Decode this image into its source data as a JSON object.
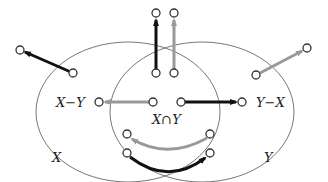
{
  "diagram": {
    "colors": {
      "ellipse": "#777777",
      "dark_arrow": "#111111",
      "light_arrow": "#999999",
      "node_stroke": "#333333",
      "node_fill": "#ffffff"
    },
    "labels": {
      "x_minus_y": "X−Y",
      "y_minus_x": "Y−X",
      "x_cap_y": "X∩Y",
      "x": "X",
      "y": "Y"
    },
    "sets": [
      {
        "name": "X",
        "cx": 128,
        "cy": 112,
        "rx": 92,
        "ry": 70
      },
      {
        "name": "Y",
        "cx": 202,
        "cy": 112,
        "rx": 92,
        "ry": 70
      }
    ],
    "arrows": [
      {
        "id": "x-out",
        "from": [
          73,
          73
        ],
        "to": [
          20,
          50
        ],
        "color": "dark",
        "curve": false
      },
      {
        "id": "xy-up-dark",
        "from": [
          156,
          73
        ],
        "to": [
          156,
          14
        ],
        "color": "dark",
        "curve": false
      },
      {
        "id": "xy-up-light",
        "from": [
          174,
          73
        ],
        "to": [
          174,
          14
        ],
        "color": "light",
        "curve": false
      },
      {
        "id": "y-out",
        "from": [
          256,
          75
        ],
        "to": [
          307,
          48
        ],
        "color": "light",
        "curve": false
      },
      {
        "id": "to-x-minus-y",
        "from": [
          153,
          102
        ],
        "to": [
          99,
          102
        ],
        "color": "light",
        "curve": false
      },
      {
        "id": "to-y-minus-x",
        "from": [
          181,
          102
        ],
        "to": [
          242,
          102
        ],
        "color": "dark",
        "curve": false
      },
      {
        "id": "bottom-light",
        "from": [
          210,
          134
        ],
        "to": [
          127,
          134
        ],
        "color": "light",
        "curve": true
      },
      {
        "id": "bottom-dark",
        "from": [
          127,
          153
        ],
        "to": [
          210,
          153
        ],
        "color": "dark",
        "curve": true
      }
    ]
  }
}
